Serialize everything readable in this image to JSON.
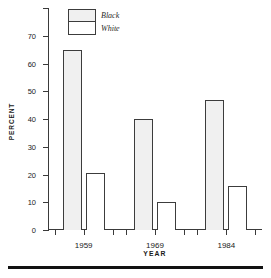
{
  "chart_data": {
    "type": "bar",
    "title": "",
    "xlabel": "YEAR",
    "ylabel": "PERCENT",
    "categories": [
      "1959",
      "1969",
      "1984"
    ],
    "series": [
      {
        "name": "Black",
        "values": [
          65,
          40,
          47
        ],
        "fill": "stipple-gray"
      },
      {
        "name": "White",
        "values": [
          20.5,
          10,
          16
        ],
        "fill": "white"
      }
    ],
    "ylim": [
      0,
      80
    ],
    "yticks": [
      0,
      10,
      20,
      30,
      40,
      50,
      60,
      70
    ],
    "ytick_labels": [
      "0",
      "10",
      "20",
      "30",
      "40",
      "50",
      "60",
      "70"
    ],
    "grid": false,
    "legend_position": "top-left-inside"
  },
  "legend": {
    "items": [
      {
        "label": "Black"
      },
      {
        "label": "White"
      }
    ]
  },
  "axes": {
    "y_title": "PERCENT",
    "x_title": "YEAR"
  }
}
